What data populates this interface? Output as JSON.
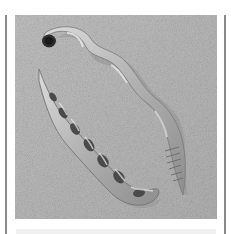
{
  "image": {
    "subject": "Two coiled worm shells lying on sand",
    "colors": {
      "sand": "#b8b8b8",
      "shell_light": "#d6d6d6",
      "shell_mid": "#a2a2a2",
      "shell_dark": "#555555",
      "frame_line": "#8a8a8a",
      "background": "#ffffff"
    }
  }
}
